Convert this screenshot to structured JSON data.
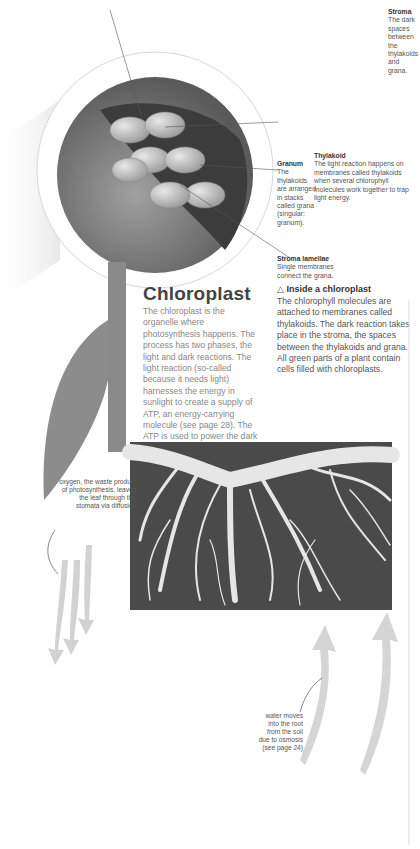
{
  "page": {
    "title": "Chloroplast",
    "body": "The chloroplast is the organelle where photosynthesis happens. The process has two phases, the light and dark reactions. The light reaction (so-called because it needs light) harnesses the energy in sunlight to create a supply of ATP, an energy-carrying molecule (see page 28). The ATP is used to power the dark reaction, where an enzyme called rubisco combines carbon dioxide and water to make glucose."
  },
  "diagram": {
    "stroma": {
      "title": "Stroma",
      "body": "The dark spaces between the thylakoids and grana."
    },
    "thylakoid": {
      "title": "Thylakoid",
      "body": "The light reaction happens on membranes called thylakoids when several chlorophyll molecules work together to trap light energy."
    },
    "granum": {
      "title": "Granum",
      "body": "The thylakoids are arranged in stacks called grana (singular: granum)."
    },
    "stroma_lamellae": {
      "title": "Stroma lamellae",
      "body": "Single membranes connect the grana."
    }
  },
  "caption": {
    "icon": "triangle-up-icon",
    "title": "Inside a chloroplast",
    "body": "The chlorophyll molecules are attached to membranes called thylakoids. The dark reaction takes place in the stroma, the spaces between the thylakoids and grana. All green parts of a plant contain cells filled with chloroplasts."
  },
  "annotations": {
    "oxygen": "oxygen, the waste product of photosynthesis, leaves the leaf through the stomata via diffusion",
    "water": "water moves into the root from the soil due to osmosis (see page 24)"
  },
  "colors": {
    "soil": "#4a4a4a",
    "root": "#e6e6e6",
    "leaf": "#8c8c8c",
    "stem": "#8a8a8a",
    "sphere": "#777777"
  }
}
